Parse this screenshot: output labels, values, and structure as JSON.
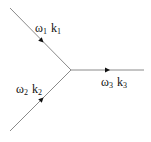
{
  "diagram": {
    "type": "three-wave interaction vertex",
    "colors": {
      "line": "#8a8a8a",
      "arrow": "#111111",
      "text": "#111111"
    },
    "junction": {
      "x": 71,
      "y": 70
    },
    "lines": [
      {
        "id": "wave1",
        "from": [
          10,
          8
        ],
        "to": [
          71,
          70
        ],
        "arrow_at": [
          40,
          39
        ],
        "direction": "incoming"
      },
      {
        "id": "wave2",
        "from": [
          10,
          131
        ],
        "to": [
          71,
          70
        ],
        "arrow_at": [
          40,
          101
        ],
        "direction": "incoming"
      },
      {
        "id": "wave3",
        "from": [
          71,
          70
        ],
        "to": [
          144,
          70
        ],
        "arrow_at": [
          107,
          70
        ],
        "direction": "outgoing"
      }
    ],
    "labels": {
      "wave1": {
        "omega": "ω",
        "omega_sub": "1",
        "k": "k",
        "k_sub": "1"
      },
      "wave2": {
        "omega": "ω",
        "omega_sub": "2",
        "k": "k",
        "k_sub": "2"
      },
      "wave3": {
        "omega": "ω",
        "omega_sub": "3",
        "k": "k",
        "k_sub": "3"
      }
    }
  }
}
